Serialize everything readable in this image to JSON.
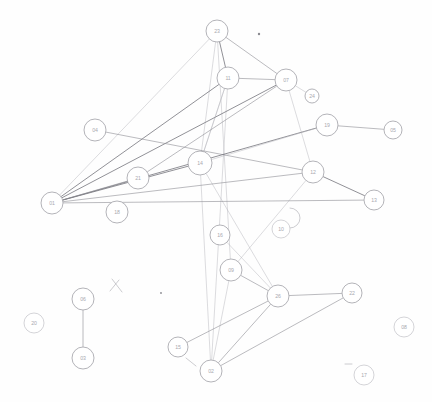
{
  "diagram": {
    "medium": "faint pencil sketch scan on white paper",
    "node_count": 25,
    "edge_count": 34,
    "background_color": "#fefefe",
    "node_fill_color": "#ffffff",
    "node_stroke_color": "#9a9aa0",
    "edge_color": "#8d8d93",
    "label_color": "#a9a9b0"
  },
  "graph_data": {
    "type": "node-link-diagram",
    "layout": "hand-drawn free placement",
    "directed": false,
    "nodes": [
      {
        "id": "n1",
        "label": "23",
        "x": 217,
        "y": 31,
        "r": 11
      },
      {
        "id": "n2",
        "label": "11",
        "x": 228,
        "y": 78,
        "r": 11
      },
      {
        "id": "n3",
        "label": "07",
        "x": 286,
        "y": 80,
        "r": 11
      },
      {
        "id": "n4",
        "label": "04",
        "x": 95,
        "y": 130,
        "r": 11
      },
      {
        "id": "n5",
        "label": "19",
        "x": 327,
        "y": 125,
        "r": 11
      },
      {
        "id": "n6",
        "label": "05",
        "x": 393,
        "y": 130,
        "r": 9
      },
      {
        "id": "n7",
        "label": "14",
        "x": 200,
        "y": 163,
        "r": 12
      },
      {
        "id": "n8",
        "label": "21",
        "x": 138,
        "y": 178,
        "r": 11
      },
      {
        "id": "n9",
        "label": "12",
        "x": 313,
        "y": 172,
        "r": 11
      },
      {
        "id": "n10",
        "label": "01",
        "x": 52,
        "y": 203,
        "r": 11
      },
      {
        "id": "n11",
        "label": "18",
        "x": 117,
        "y": 212,
        "r": 11
      },
      {
        "id": "n12",
        "label": "13",
        "x": 374,
        "y": 200,
        "r": 10
      },
      {
        "id": "n13",
        "label": "16",
        "x": 220,
        "y": 235,
        "r": 10
      },
      {
        "id": "n14",
        "label": "09",
        "x": 231,
        "y": 270,
        "r": 11
      },
      {
        "id": "n15",
        "label": "26",
        "x": 278,
        "y": 296,
        "r": 11
      },
      {
        "id": "n16",
        "label": "22",
        "x": 352,
        "y": 293,
        "r": 10
      },
      {
        "id": "n17",
        "label": "06",
        "x": 83,
        "y": 299,
        "r": 11
      },
      {
        "id": "n18",
        "label": "20",
        "x": 34,
        "y": 323,
        "r": 10
      },
      {
        "id": "n19",
        "label": "03",
        "x": 83,
        "y": 358,
        "r": 11
      },
      {
        "id": "n20",
        "label": "15",
        "x": 178,
        "y": 347,
        "r": 10
      },
      {
        "id": "n21",
        "label": "02",
        "x": 211,
        "y": 371,
        "r": 11
      },
      {
        "id": "n22",
        "label": "08",
        "x": 404,
        "y": 327,
        "r": 10
      },
      {
        "id": "n23",
        "label": "17",
        "x": 364,
        "y": 375,
        "r": 10
      },
      {
        "id": "n24",
        "label": "10",
        "x": 281,
        "y": 229,
        "r": 9
      },
      {
        "id": "n25",
        "label": "24",
        "x": 312,
        "y": 96,
        "r": 7
      }
    ],
    "edges": [
      {
        "source": "n1",
        "target": "n2",
        "weight": "strong"
      },
      {
        "source": "n1",
        "target": "n3",
        "weight": "normal"
      },
      {
        "source": "n1",
        "target": "n7",
        "weight": "faint"
      },
      {
        "source": "n1",
        "target": "n10",
        "weight": "faint"
      },
      {
        "source": "n1",
        "target": "n14",
        "weight": "faint"
      },
      {
        "source": "n2",
        "target": "n3",
        "weight": "normal"
      },
      {
        "source": "n2",
        "target": "n10",
        "weight": "strong"
      },
      {
        "source": "n2",
        "target": "n7",
        "weight": "faint"
      },
      {
        "source": "n2",
        "target": "n21",
        "weight": "faint"
      },
      {
        "source": "n3",
        "target": "n10",
        "weight": "strong"
      },
      {
        "source": "n3",
        "target": "n9",
        "weight": "faint"
      },
      {
        "source": "n3",
        "target": "n25",
        "weight": "faint"
      },
      {
        "source": "n4",
        "target": "n9",
        "weight": "normal"
      },
      {
        "source": "n5",
        "target": "n6",
        "weight": "normal"
      },
      {
        "source": "n5",
        "target": "n10",
        "weight": "strong"
      },
      {
        "source": "n5",
        "target": "n7",
        "weight": "faint"
      },
      {
        "source": "n7",
        "target": "n10",
        "weight": "strong"
      },
      {
        "source": "n7",
        "target": "n2",
        "weight": "faint"
      },
      {
        "source": "n7",
        "target": "n15",
        "weight": "faint"
      },
      {
        "source": "n7",
        "target": "n21",
        "weight": "faint"
      },
      {
        "source": "n8",
        "target": "n10",
        "weight": "normal"
      },
      {
        "source": "n8",
        "target": "n3",
        "weight": "normal"
      },
      {
        "source": "n9",
        "target": "n12",
        "weight": "strong"
      },
      {
        "source": "n9",
        "target": "n10",
        "weight": "normal"
      },
      {
        "source": "n9",
        "target": "n14",
        "weight": "faint"
      },
      {
        "source": "n10",
        "target": "n12",
        "weight": "normal"
      },
      {
        "source": "n13",
        "target": "n15",
        "weight": "faint"
      },
      {
        "source": "n14",
        "target": "n15",
        "weight": "normal"
      },
      {
        "source": "n14",
        "target": "n21",
        "weight": "faint"
      },
      {
        "source": "n15",
        "target": "n16",
        "weight": "normal"
      },
      {
        "source": "n15",
        "target": "n20",
        "weight": "normal"
      },
      {
        "source": "n15",
        "target": "n21",
        "weight": "normal"
      },
      {
        "source": "n16",
        "target": "n21",
        "weight": "normal"
      },
      {
        "source": "n17",
        "target": "n19",
        "weight": "normal"
      }
    ],
    "isolated_nodes": [
      "n18",
      "n22",
      "n23",
      "n24"
    ],
    "hub_nodes": [
      "n10",
      "n7",
      "n15",
      "n3"
    ],
    "annotations": [
      {
        "kind": "speck",
        "x": 259,
        "y": 34,
        "r": 1.2
      },
      {
        "kind": "speck",
        "x": 161,
        "y": 293,
        "r": 0.9
      },
      {
        "kind": "stray-tick",
        "x1": 112,
        "y1": 279,
        "x2": 122,
        "y2": 292
      },
      {
        "kind": "stray-tick",
        "x1": 119,
        "y1": 280,
        "x2": 110,
        "y2": 291
      },
      {
        "kind": "stray-tick",
        "x1": 186,
        "y1": 358,
        "x2": 196,
        "y2": 366
      },
      {
        "kind": "stray-tick",
        "x1": 345,
        "y1": 364,
        "x2": 352,
        "y2": 364
      },
      {
        "kind": "stray-arc",
        "x": 290,
        "y": 218,
        "r": 10
      }
    ]
  }
}
